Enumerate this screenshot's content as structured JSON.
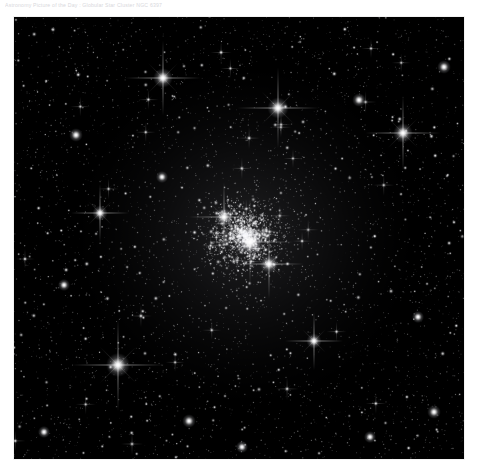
{
  "caption": {
    "text": "Astronomy Picture of the Day : Globular Star Cluster NGC 6397"
  },
  "figure": {
    "alt_name": "star-cluster-image",
    "background_color": "#000000",
    "frame_border_color": "#f2f2f2",
    "star_color": "#ffffff",
    "x": 14,
    "y": 17,
    "width": 450,
    "height": 442
  },
  "chart_data": {
    "type": "scatter",
    "title": "",
    "xlabel": "",
    "ylabel": "",
    "xlim": [
      0,
      450
    ],
    "ylim": [
      0,
      442
    ],
    "grid": false,
    "legend": null,
    "cluster_core": {
      "x": 231,
      "y": 218,
      "radius": 95,
      "peak_density": 1.0
    },
    "bright_stars": [
      {
        "x": 149,
        "y": 61,
        "size": 13,
        "spikes": true
      },
      {
        "x": 264,
        "y": 91,
        "size": 14,
        "spikes": true
      },
      {
        "x": 389,
        "y": 116,
        "size": 13,
        "spikes": true
      },
      {
        "x": 104,
        "y": 348,
        "size": 16,
        "spikes": true
      },
      {
        "x": 236,
        "y": 225,
        "size": 15,
        "spikes": true
      },
      {
        "x": 210,
        "y": 200,
        "size": 12,
        "spikes": true
      },
      {
        "x": 255,
        "y": 247,
        "size": 12,
        "spikes": true
      },
      {
        "x": 86,
        "y": 196,
        "size": 10,
        "spikes": true
      },
      {
        "x": 345,
        "y": 83,
        "size": 9,
        "spikes": false
      },
      {
        "x": 430,
        "y": 50,
        "size": 9,
        "spikes": false
      },
      {
        "x": 62,
        "y": 118,
        "size": 9,
        "spikes": false
      },
      {
        "x": 300,
        "y": 324,
        "size": 10,
        "spikes": true
      },
      {
        "x": 50,
        "y": 268,
        "size": 8,
        "spikes": false
      },
      {
        "x": 404,
        "y": 300,
        "size": 8,
        "spikes": false
      },
      {
        "x": 175,
        "y": 404,
        "size": 9,
        "spikes": false
      },
      {
        "x": 356,
        "y": 420,
        "size": 8,
        "spikes": false
      },
      {
        "x": 228,
        "y": 430,
        "size": 8,
        "spikes": false
      },
      {
        "x": 420,
        "y": 395,
        "size": 9,
        "spikes": false
      },
      {
        "x": 30,
        "y": 415,
        "size": 8,
        "spikes": false
      },
      {
        "x": 148,
        "y": 160,
        "size": 8,
        "spikes": false
      }
    ],
    "total_point_sources": 4200,
    "faint_star_count": 3600,
    "medium_star_count": 580,
    "value_range": [
      0,
      255
    ]
  }
}
